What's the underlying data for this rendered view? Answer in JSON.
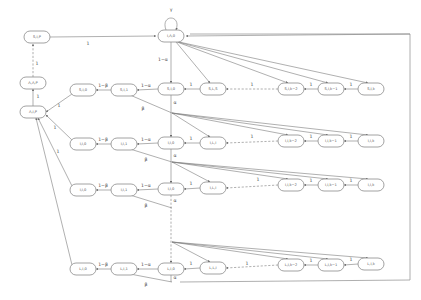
{
  "diagram": {
    "type": "state-transition-graph",
    "nodes": [
      {
        "id": "n_sip",
        "label": "S,I,P",
        "x": 37,
        "y": 37
      },
      {
        "id": "n_top",
        "label": "I,Λ,0",
        "x": 171,
        "y": 36
      },
      {
        "id": "n_lalp",
        "label": "Λ,Λ,P",
        "x": 33,
        "y": 83
      },
      {
        "id": "n_lip",
        "label": "Λ,I,P",
        "x": 33,
        "y": 112
      },
      {
        "id": "r1_c1",
        "label": "S,I,0",
        "x": 83,
        "y": 90
      },
      {
        "id": "r1_c2",
        "label": "S,I,1",
        "x": 124,
        "y": 90
      },
      {
        "id": "r1_c3",
        "label": "S,I,0",
        "x": 171,
        "y": 89
      },
      {
        "id": "r1_c4",
        "label": "S,L,S",
        "x": 213,
        "y": 89
      },
      {
        "id": "r1_c5",
        "label": "S,I,k−2",
        "x": 291,
        "y": 89
      },
      {
        "id": "r1_c6",
        "label": "S,I,k−1",
        "x": 331,
        "y": 89
      },
      {
        "id": "r1_c7",
        "label": "S,I,k",
        "x": 371,
        "y": 89
      },
      {
        "id": "r2_c1",
        "label": "I,I,0",
        "x": 83,
        "y": 144
      },
      {
        "id": "r2_c2",
        "label": "I,I,1",
        "x": 124,
        "y": 144
      },
      {
        "id": "r2_c3",
        "label": "I,I,0",
        "x": 171,
        "y": 143
      },
      {
        "id": "r2_c4",
        "label": "I,L,I",
        "x": 213,
        "y": 143
      },
      {
        "id": "r2_c5",
        "label": "I,I,k−2",
        "x": 291,
        "y": 141
      },
      {
        "id": "r2_c6",
        "label": "I,I,k−1",
        "x": 331,
        "y": 141
      },
      {
        "id": "r2_c7",
        "label": "I,I,k",
        "x": 371,
        "y": 141
      },
      {
        "id": "r3_c1",
        "label": "I,I,0",
        "x": 83,
        "y": 190
      },
      {
        "id": "r3_c2",
        "label": "I,I,1",
        "x": 124,
        "y": 190
      },
      {
        "id": "r3_c3",
        "label": "I,I,0",
        "x": 171,
        "y": 189
      },
      {
        "id": "r3_c4",
        "label": "I,L,I",
        "x": 213,
        "y": 188
      },
      {
        "id": "r3_c5",
        "label": "I,I,k−2",
        "x": 291,
        "y": 185
      },
      {
        "id": "r3_c6",
        "label": "I,I,k−1",
        "x": 331,
        "y": 185
      },
      {
        "id": "r3_c7",
        "label": "I,I,k",
        "x": 371,
        "y": 185
      },
      {
        "id": "r4_c1",
        "label": "L,I,0",
        "x": 83,
        "y": 269
      },
      {
        "id": "r4_c2",
        "label": "L,I,1",
        "x": 124,
        "y": 269
      },
      {
        "id": "r4_c3",
        "label": "L,I,0",
        "x": 171,
        "y": 269
      },
      {
        "id": "r4_c4",
        "label": "L,L,I",
        "x": 213,
        "y": 268
      },
      {
        "id": "r4_c5",
        "label": "L,I,k−2",
        "x": 291,
        "y": 265
      },
      {
        "id": "r4_c6",
        "label": "L,I,k−1",
        "x": 331,
        "y": 265
      },
      {
        "id": "r4_c7",
        "label": "L,I,k",
        "x": 371,
        "y": 264
      }
    ],
    "edge_labels": {
      "self_loop": "γ",
      "sip_to_top": "1",
      "lalp_to_sip": "1",
      "lip_to_lalp": "1",
      "top_down": "1−α",
      "row_to_c1": "1−β",
      "row_c3_to_c2": "1−α",
      "row_c4_to_c3": "1",
      "chain": "1",
      "down_alpha": "α",
      "beta": "β",
      "to_lip": "1"
    }
  }
}
